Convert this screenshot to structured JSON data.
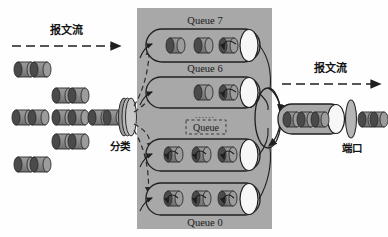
{
  "diagram": {
    "colors": {
      "background": "#fefefe",
      "gray_panel": "#a8a8a8",
      "queue_fill": "#b0b0b0",
      "packet_dark": "#4a4a4a",
      "packet_light": "#8d8d8d",
      "packet_edge": "#2b2b2b",
      "white_cap": "#f7f7f7",
      "line": "#1f1f1f",
      "dashed": "#2a2a2a"
    },
    "labels": {
      "inflow": "报文流",
      "outflow": "报文流",
      "classifier": "分类",
      "port": "端口"
    },
    "queues": [
      {
        "name": "Queue 7",
        "label_position": "above",
        "packets": 3,
        "row": 0
      },
      {
        "name": "Queue 6",
        "label_position": "above",
        "packets": 2,
        "row": 1
      },
      {
        "name": "Queue",
        "label_position": "above",
        "packets": 3,
        "row": 2,
        "ellipsis": "......",
        "dashed_label_box": true
      },
      {
        "name": "Queue 0",
        "label_position": "below",
        "packets": 3,
        "row": 3
      }
    ],
    "ingress_packet_rows": [
      {
        "count": 2
      },
      {
        "count": 2
      },
      {
        "count": 6
      },
      {
        "count": 2
      },
      {
        "count": 2
      }
    ],
    "egress": {
      "queue_packets": 3,
      "after_port_packets": 3
    },
    "scheduler": {
      "shape": "loop-ellipse",
      "arrows": 2
    }
  }
}
